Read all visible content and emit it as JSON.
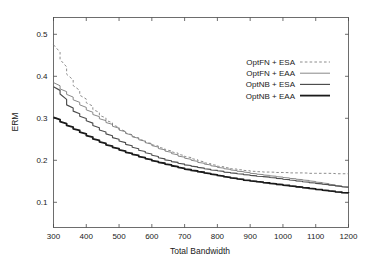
{
  "chart_data": {
    "type": "line",
    "title": "",
    "xlabel": "Total Bandwidth",
    "ylabel": "ERM",
    "xlim": [
      300,
      1200
    ],
    "ylim": [
      0.04,
      0.54
    ],
    "grid": false,
    "legend_position": "upper right",
    "xticks": [
      300,
      400,
      500,
      600,
      700,
      800,
      900,
      1000,
      1100,
      1200
    ],
    "xtick_labels": [
      "300",
      "400",
      "500",
      "600",
      "700",
      "800",
      "900",
      "1000",
      "1100",
      "1200"
    ],
    "yticks": [
      0.1,
      0.2,
      0.3,
      0.4,
      0.5
    ],
    "ytick_labels": [
      "0.1",
      "0.2",
      "0.3",
      "0.4",
      "0.5"
    ],
    "x": [
      300,
      320,
      340,
      360,
      380,
      400,
      420,
      440,
      460,
      480,
      500,
      520,
      540,
      560,
      580,
      600,
      620,
      640,
      660,
      680,
      700,
      720,
      740,
      760,
      780,
      800,
      820,
      840,
      860,
      880,
      900,
      920,
      940,
      960,
      980,
      1000,
      1020,
      1040,
      1060,
      1080,
      1100,
      1120,
      1140,
      1160,
      1180,
      1200
    ],
    "series": [
      {
        "name": "OptFN + ESA",
        "style": "dashed",
        "color": "#808080",
        "width": 0.9,
        "values": [
          0.475,
          0.44,
          0.405,
          0.378,
          0.355,
          0.337,
          0.321,
          0.307,
          0.295,
          0.284,
          0.274,
          0.265,
          0.257,
          0.25,
          0.243,
          0.237,
          0.231,
          0.225,
          0.22,
          0.214,
          0.209,
          0.204,
          0.199,
          0.194,
          0.19,
          0.186,
          0.183,
          0.18,
          0.178,
          0.176,
          0.174,
          0.173,
          0.172,
          0.172,
          0.171,
          0.171,
          0.17,
          0.17,
          0.17,
          0.169,
          0.169,
          0.169,
          0.169,
          0.168,
          0.168,
          0.168
        ]
      },
      {
        "name": "OptFN + EAA",
        "style": "solid",
        "color": "#7a7a7a",
        "width": 0.9,
        "values": [
          0.385,
          0.37,
          0.357,
          0.344,
          0.332,
          0.32,
          0.309,
          0.299,
          0.29,
          0.281,
          0.272,
          0.264,
          0.256,
          0.249,
          0.242,
          0.235,
          0.228,
          0.222,
          0.216,
          0.21,
          0.205,
          0.2,
          0.195,
          0.191,
          0.187,
          0.183,
          0.18,
          0.177,
          0.174,
          0.172,
          0.169,
          0.167,
          0.165,
          0.163,
          0.161,
          0.159,
          0.157,
          0.155,
          0.153,
          0.151,
          0.148,
          0.146,
          0.143,
          0.14,
          0.137,
          0.135
        ]
      },
      {
        "name": "OptNB + ESA",
        "style": "solid",
        "color": "#4d4d4d",
        "width": 1.15,
        "values": [
          0.375,
          0.358,
          0.332,
          0.317,
          0.305,
          0.294,
          0.283,
          0.272,
          0.263,
          0.254,
          0.246,
          0.238,
          0.231,
          0.224,
          0.218,
          0.212,
          0.206,
          0.201,
          0.197,
          0.193,
          0.189,
          0.186,
          0.183,
          0.18,
          0.177,
          0.175,
          0.172,
          0.17,
          0.168,
          0.166,
          0.164,
          0.162,
          0.161,
          0.159,
          0.157,
          0.155,
          0.153,
          0.151,
          0.149,
          0.147,
          0.145,
          0.143,
          0.141,
          0.139,
          0.137,
          0.135
        ]
      },
      {
        "name": "OptNB + EAA",
        "style": "solid",
        "color": "#1a1a1a",
        "width": 1.8,
        "values": [
          0.302,
          0.292,
          0.283,
          0.275,
          0.267,
          0.259,
          0.251,
          0.244,
          0.237,
          0.231,
          0.225,
          0.219,
          0.214,
          0.209,
          0.204,
          0.199,
          0.195,
          0.191,
          0.187,
          0.183,
          0.179,
          0.176,
          0.173,
          0.17,
          0.167,
          0.164,
          0.161,
          0.158,
          0.156,
          0.153,
          0.151,
          0.149,
          0.147,
          0.145,
          0.143,
          0.141,
          0.139,
          0.137,
          0.135,
          0.133,
          0.131,
          0.129,
          0.127,
          0.125,
          0.123,
          0.122
        ]
      }
    ]
  }
}
